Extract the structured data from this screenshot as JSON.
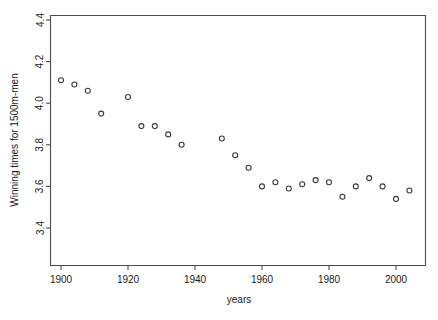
{
  "chart_data": {
    "type": "scatter",
    "title": "",
    "xlabel": "years",
    "ylabel": "Winning times for 1500m-men",
    "xlim": [
      1896,
      2008
    ],
    "ylim": [
      3.33,
      4.45
    ],
    "xticks": [
      1900,
      1920,
      1940,
      1960,
      1980,
      2000
    ],
    "xticklabels": [
      "1900",
      "1920",
      "1940",
      "1960",
      "1980",
      "2000"
    ],
    "yticks": [
      3.4,
      3.6,
      3.8,
      4.0,
      4.2,
      4.4
    ],
    "yticklabels": [
      "3.4",
      "3.6",
      "3.8",
      "4.0",
      "4.2",
      "4.4"
    ],
    "grid": false,
    "legend": null,
    "marker": "open-circle",
    "x": [
      1900,
      1904,
      1908,
      1912,
      1920,
      1924,
      1928,
      1932,
      1936,
      1948,
      1952,
      1956,
      1960,
      1964,
      1968,
      1972,
      1976,
      1980,
      1984,
      1988,
      1992,
      1996,
      2000,
      2004
    ],
    "y": [
      4.11,
      4.09,
      4.06,
      3.95,
      4.03,
      3.89,
      3.89,
      3.85,
      3.8,
      3.83,
      3.75,
      3.69,
      3.6,
      3.62,
      3.59,
      3.61,
      3.63,
      3.62,
      3.55,
      3.6,
      3.64,
      3.6,
      3.54,
      3.58
    ],
    "points": [
      {
        "year": 1900,
        "time": 4.11
      },
      {
        "year": 1904,
        "time": 4.09
      },
      {
        "year": 1908,
        "time": 4.06
      },
      {
        "year": 1912,
        "time": 3.95
      },
      {
        "year": 1920,
        "time": 4.03
      },
      {
        "year": 1924,
        "time": 3.89
      },
      {
        "year": 1928,
        "time": 3.89
      },
      {
        "year": 1932,
        "time": 3.85
      },
      {
        "year": 1936,
        "time": 3.8
      },
      {
        "year": 1948,
        "time": 3.83
      },
      {
        "year": 1952,
        "time": 3.75
      },
      {
        "year": 1956,
        "time": 3.69
      },
      {
        "year": 1960,
        "time": 3.6
      },
      {
        "year": 1964,
        "time": 3.62
      },
      {
        "year": 1968,
        "time": 3.59
      },
      {
        "year": 1972,
        "time": 3.61
      },
      {
        "year": 1976,
        "time": 3.63
      },
      {
        "year": 1980,
        "time": 3.62
      },
      {
        "year": 1984,
        "time": 3.55
      },
      {
        "year": 1988,
        "time": 3.6
      },
      {
        "year": 1992,
        "time": 3.64
      },
      {
        "year": 1996,
        "time": 3.6
      },
      {
        "year": 2000,
        "time": 3.54
      },
      {
        "year": 2004,
        "time": 3.58
      }
    ]
  },
  "axes": {
    "x_title": "years",
    "y_title": "Winning times for 1500m-men"
  },
  "colors": {
    "point_stroke": "#3a3a3a",
    "axis": "#4d4d4d",
    "text": "#1a1a1a",
    "background": "#ffffff"
  }
}
